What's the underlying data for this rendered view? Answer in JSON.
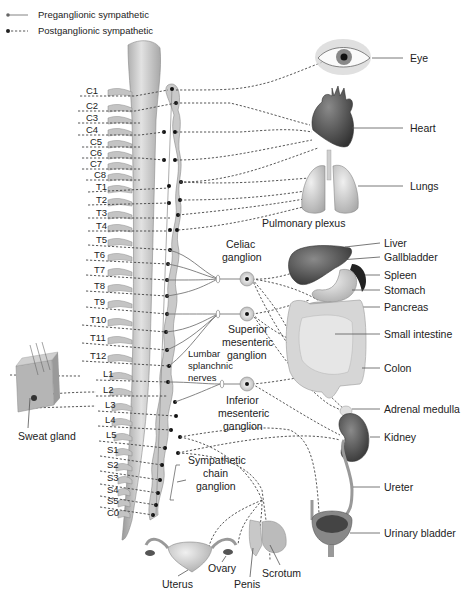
{
  "legend": {
    "preganglionic": "Preganglionic sympathetic",
    "postganglionic": "Postganglionic sympathetic"
  },
  "spinal_segments": [
    "C1",
    "C2",
    "C3",
    "C4",
    "C5",
    "C6",
    "C7",
    "C8",
    "T1",
    "T2",
    "T3",
    "T4",
    "T5",
    "T6",
    "T7",
    "T8",
    "T9",
    "T10",
    "T11",
    "T12",
    "L1",
    "L2",
    "L3",
    "L4",
    "L5",
    "S1",
    "S2",
    "S3",
    "S4",
    "S5",
    "C0"
  ],
  "ganglia": {
    "celiac": [
      "Celiac",
      "ganglion"
    ],
    "superior_mesenteric": [
      "Superior",
      "mesenteric",
      "ganglion"
    ],
    "inferior_mesenteric": [
      "Inferior",
      "mesenteric",
      "ganglion"
    ],
    "lumbar_splanchnic": [
      "Lumbar",
      "splanchnic",
      "nerves"
    ],
    "sympathetic_chain": [
      "Sympathetic",
      "chain",
      "ganglion"
    ]
  },
  "organs": {
    "eye": "Eye",
    "heart": "Heart",
    "lungs": "Lungs",
    "pulmonary_plexus": "Pulmonary plexus",
    "liver": "Liver",
    "gallbladder": "Gallbladder",
    "spleen": "Spleen",
    "stomach": "Stomach",
    "pancreas": "Pancreas",
    "small_intestine": "Small intestine",
    "colon": "Colon",
    "adrenal_medulla": "Adrenal medulla",
    "kidney": "Kidney",
    "ureter": "Ureter",
    "urinary_bladder": "Urinary bladder",
    "sweat_gland": "Sweat gland",
    "uterus": "Uterus",
    "ovary": "Ovary",
    "penis": "Penis",
    "scrotum": "Scrotum"
  },
  "colors": {
    "line": "#444444",
    "organ_dark": "#3a3a3a",
    "organ_mid": "#8a8a8a",
    "organ_light": "#cfcfcf",
    "spine": "#bdbdbd"
  }
}
